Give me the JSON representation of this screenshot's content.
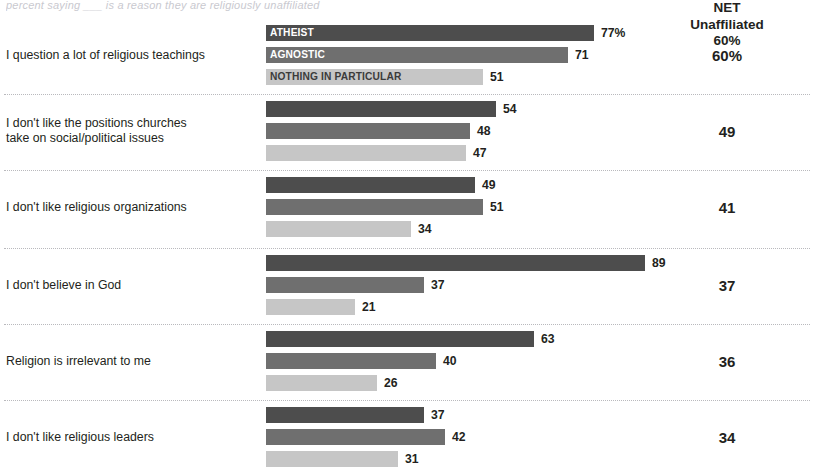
{
  "top_cutoff_text": "percent saying ___ is a reason they are religiously unaffiliated",
  "net": {
    "header_line1": "NET",
    "header_line2": "Unaffiliated",
    "header_line3": "60%"
  },
  "series_labels": [
    "ATHEIST",
    "AGNOSTIC",
    "NOTHING IN PARTICULAR"
  ],
  "chart_data": {
    "type": "bar",
    "title": "",
    "subtitle": "",
    "xlabel": "",
    "ylabel": "",
    "orientation": "horizontal",
    "grid": false,
    "legend_position": "in-bar-labels",
    "xlim": [
      0,
      100
    ],
    "categories": [
      "I question a lot of religious teachings",
      "I don't like the positions churches take on social/political issues",
      "I don't like religious organizations",
      "I don't believe in God",
      "Religion is irrelevant to me",
      "I don't like religious leaders"
    ],
    "series": [
      {
        "name": "ATHEIST",
        "color": "#4d4d4d",
        "values": [
          77,
          54,
          49,
          89,
          63,
          37
        ]
      },
      {
        "name": "AGNOSTIC",
        "color": "#6f6f6f",
        "values": [
          71,
          48,
          51,
          37,
          40,
          42
        ]
      },
      {
        "name": "NOTHING IN PARTICULAR",
        "color": "#c6c6c6",
        "values": [
          51,
          47,
          34,
          21,
          26,
          31
        ]
      }
    ],
    "value_labels": [
      [
        "77%",
        "71",
        "51"
      ],
      [
        "54",
        "48",
        "47"
      ],
      [
        "49",
        "51",
        "34"
      ],
      [
        "89",
        "37",
        "21"
      ],
      [
        "63",
        "40",
        "26"
      ],
      [
        "37",
        "42",
        "31"
      ]
    ],
    "net_column": {
      "header": "NET Unaffiliated",
      "values": [
        "60%",
        "49",
        "41",
        "37",
        "36",
        "34"
      ]
    }
  },
  "groups": [
    {
      "label_line1": "I question a lot of religious teachings",
      "label_line2": "",
      "net": "60%"
    },
    {
      "label_line1": "I don't like the positions churches",
      "label_line2": "take on social/political issues",
      "net": "49"
    },
    {
      "label_line1": "I don't like religious organizations",
      "label_line2": "",
      "net": "41"
    },
    {
      "label_line1": "I don't believe in God",
      "label_line2": "",
      "net": "37"
    },
    {
      "label_line1": "Religion is irrelevant to me",
      "label_line2": "",
      "net": "36"
    },
    {
      "label_line1": "I don't like religious leaders",
      "label_line2": "",
      "net": "34"
    }
  ]
}
